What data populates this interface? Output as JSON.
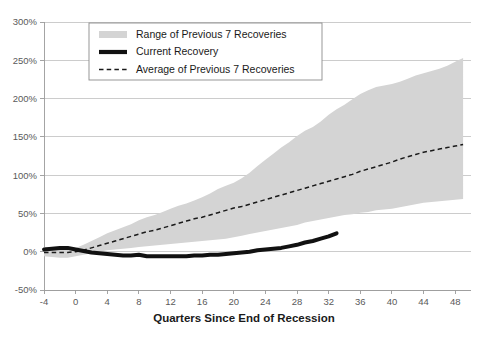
{
  "chart_data": {
    "type": "area",
    "title": "",
    "subtitle": "",
    "xlabel": "Quarters Since End of Recession",
    "ylabel": "",
    "xlim": [
      -4,
      50
    ],
    "ylim": [
      -50,
      300
    ],
    "yticks": [
      -50,
      0,
      50,
      100,
      150,
      200,
      250,
      300
    ],
    "ytick_labels": [
      "-50%",
      "0%",
      "50%",
      "100%",
      "150%",
      "200%",
      "250%",
      "300%"
    ],
    "xticks": [
      -4,
      0,
      4,
      8,
      12,
      16,
      20,
      24,
      28,
      32,
      36,
      40,
      44,
      48
    ],
    "xtick_labels": [
      "-4",
      "0",
      "4",
      "8",
      "12",
      "16",
      "20",
      "24",
      "28",
      "32",
      "36",
      "40",
      "44",
      "48"
    ],
    "grid": "horizontal",
    "legend_position": "top-center",
    "x": [
      -4,
      -3,
      -2,
      -1,
      0,
      1,
      2,
      3,
      4,
      5,
      6,
      7,
      8,
      9,
      10,
      11,
      12,
      13,
      14,
      15,
      16,
      17,
      18,
      19,
      20,
      21,
      22,
      23,
      24,
      25,
      26,
      27,
      28,
      29,
      30,
      31,
      32,
      33,
      34,
      35,
      36,
      37,
      38,
      39,
      40,
      41,
      42,
      43,
      44,
      45,
      46,
      47,
      48,
      49
    ],
    "series": [
      {
        "name": "Range of Previous 7 Recoveries",
        "kind": "band",
        "color": "#d4d4d4",
        "upper": [
          6,
          6,
          6,
          6,
          5,
          9,
          14,
          19,
          24,
          28,
          32,
          36,
          41,
          45,
          48,
          52,
          56,
          60,
          63,
          67,
          71,
          76,
          82,
          86,
          90,
          96,
          103,
          112,
          120,
          128,
          136,
          143,
          151,
          158,
          163,
          170,
          179,
          186,
          192,
          199,
          206,
          211,
          215,
          217,
          219,
          222,
          226,
          230,
          233,
          236,
          239,
          243,
          248,
          253
        ],
        "lower": [
          -6,
          -7,
          -8,
          -8,
          -6,
          -4,
          -2,
          0,
          2,
          3,
          4,
          5,
          6,
          7,
          8,
          9,
          10,
          11,
          12,
          13,
          14,
          15,
          16,
          17,
          19,
          21,
          23,
          25,
          27,
          29,
          31,
          33,
          35,
          38,
          40,
          42,
          44,
          46,
          48,
          49,
          51,
          52,
          54,
          55,
          56,
          58,
          60,
          62,
          64,
          65,
          66,
          67,
          68,
          69
        ]
      },
      {
        "name": "Average of Previous 7 Recoveries",
        "kind": "dashed-line",
        "color": "#1a1a1a",
        "values": [
          -1,
          -1,
          -1,
          -1,
          0,
          2,
          5,
          8,
          11,
          14,
          17,
          20,
          23,
          26,
          28,
          31,
          34,
          37,
          40,
          43,
          45,
          48,
          51,
          54,
          57,
          59,
          62,
          65,
          68,
          71,
          74,
          77,
          80,
          83,
          86,
          89,
          92,
          95,
          98,
          101,
          105,
          108,
          111,
          114,
          117,
          121,
          124,
          127,
          130,
          132,
          134,
          136,
          138,
          140
        ]
      },
      {
        "name": "Current Recovery",
        "kind": "thick-line",
        "color": "#111111",
        "values": [
          3,
          4,
          5,
          5,
          3,
          1,
          -1,
          -2,
          -3,
          -4,
          -5,
          -5,
          -4,
          -6,
          -6,
          -6,
          -6,
          -6,
          -6,
          -5,
          -5,
          -4,
          -4,
          -3,
          -2,
          -1,
          0,
          2,
          3,
          4,
          5,
          7,
          9,
          12,
          14,
          17,
          20,
          24,
          null,
          null,
          null,
          null,
          null,
          null,
          null,
          null,
          null,
          null,
          null,
          null,
          null,
          null,
          null,
          null
        ]
      }
    ],
    "legend": [
      {
        "label": "Range of Previous 7 Recoveries",
        "marker": "band-swatch",
        "color": "#d4d4d4"
      },
      {
        "label": "Current Recovery",
        "marker": "thick-line-swatch",
        "color": "#111111"
      },
      {
        "label": "Average of Previous 7 Recoveries",
        "marker": "dashed-line-swatch",
        "color": "#1a1a1a"
      }
    ]
  },
  "plot": {
    "left": 44,
    "right": 471,
    "top": 22,
    "bottom": 290
  },
  "legend_box": {
    "left": 89,
    "top": 23,
    "width": 233,
    "height": 57
  }
}
